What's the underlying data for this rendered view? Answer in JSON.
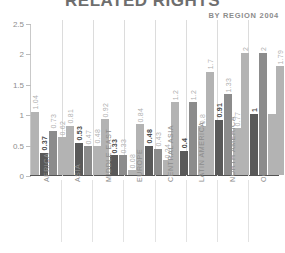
{
  "header": {
    "title": "RELATED RIGHTS",
    "subtitle": "BY REGION 2004"
  },
  "colors": {
    "series_light": "#b3b3b3",
    "series_dark": "#595959",
    "series_mid": "#8c8c8c",
    "axis": "#545454",
    "grid": "#dcdcdc",
    "tick_text": "#8e8e8e",
    "label_text": "#8d8d8d"
  },
  "chart_data": {
    "type": "bar",
    "title": "RELATED RIGHTS",
    "subtitle": "BY REGION 2004",
    "xlabel": "",
    "ylabel": "",
    "ylim": [
      0,
      2.5
    ],
    "yticks": [
      "0",
      "0.5",
      "1",
      "1.5",
      "2",
      "2.5"
    ],
    "ytick_values": [
      0,
      0.5,
      1,
      1.5,
      2,
      2.5
    ],
    "grid": false,
    "legend": "none",
    "categories": [
      "AFRICA",
      "ASIA",
      "MIDDLE EAST",
      "EUROPE",
      "CENTRAL ASIA",
      "LATIN AMERICA",
      "NORTH AMERICA",
      "OCEANIA"
    ],
    "series": [
      {
        "name": "series-1",
        "color": "#b3b3b3",
        "values": [
          1.04,
          0.81,
          0.92,
          0.84,
          1.2,
          1.7,
          2.0,
          1.79
        ],
        "labels": [
          "1.04",
          "0.81",
          "0.92",
          "0.84",
          "1.2",
          "1.7",
          "2",
          "1.79"
        ]
      },
      {
        "name": "series-2",
        "color": "#595959",
        "values": [
          0.37,
          0.53,
          0.33,
          0.48,
          0.4,
          0.91,
          1.0,
          0.93
        ],
        "labels": [
          "0.37",
          "0.53",
          "0.33",
          "0.48",
          "0.4",
          "0.91",
          "1",
          "0.93"
        ]
      },
      {
        "name": "series-3",
        "color": "#8c8c8c",
        "values": [
          0.73,
          0.47,
          0.33,
          0.43,
          1.2,
          1.33,
          2.0,
          1.9
        ],
        "labels": [
          "0.73",
          "0.47",
          "0.33",
          "0.43",
          "1.2",
          "1.33",
          "2",
          "1.9"
        ]
      },
      {
        "name": "series-4",
        "color": "#b3b3b3",
        "values": [
          0.62,
          0.48,
          0.08,
          0.24,
          0.8,
          0.77,
          1.0,
          1.0
        ],
        "labels": [
          "0.62",
          "0.48",
          "0.08",
          "0.24",
          "0.8",
          "0.77",
          "",
          ""
        ]
      }
    ]
  }
}
